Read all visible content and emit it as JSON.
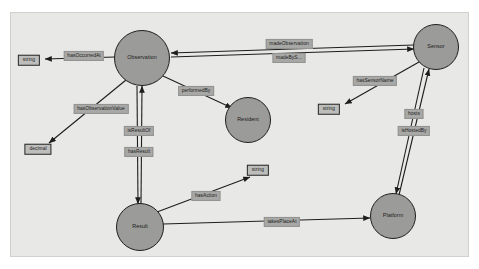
{
  "diagram": {
    "panel": {
      "background": "#e8e8e6",
      "border": "#d0d0cd"
    },
    "node_fill": "#9b9b99",
    "node_stroke": "#1f1f1f",
    "edge_label_fill": "#a8a8a6",
    "literal_fill": "#bdbdbb",
    "edge_stroke": "#1d1d1d",
    "nodes": [
      {
        "id": "observation",
        "label": "Observation",
        "shape": "circle",
        "cx": 142,
        "cy": 58,
        "r": 27
      },
      {
        "id": "sensor",
        "label": "Sensor",
        "shape": "circle",
        "cx": 436,
        "cy": 47,
        "r": 22
      },
      {
        "id": "resident",
        "label": "Resident",
        "shape": "circle",
        "cx": 248,
        "cy": 120,
        "r": 22
      },
      {
        "id": "result",
        "label": "Result",
        "shape": "circle",
        "cx": 140,
        "cy": 227,
        "r": 23
      },
      {
        "id": "platform",
        "label": "Platform",
        "shape": "circle",
        "cx": 393,
        "cy": 216,
        "r": 22
      }
    ],
    "literals": [
      {
        "id": "string-occurred",
        "label": "string",
        "cx": 29,
        "cy": 60
      },
      {
        "id": "decimal-value",
        "label": "decimal",
        "cx": 38,
        "cy": 149
      },
      {
        "id": "string-sensorname",
        "label": "string",
        "cx": 329,
        "cy": 109
      },
      {
        "id": "string-action",
        "label": "string",
        "cx": 258,
        "cy": 170
      }
    ],
    "edges": [
      {
        "id": "hasOccurredAt",
        "label": "hasOccurredAt",
        "from": "observation",
        "to": "string-occurred",
        "lx": 84,
        "ly": 56
      },
      {
        "id": "hasObservationValue",
        "label": "hasObservationValue",
        "from": "observation",
        "to": "decimal-value",
        "lx": 101,
        "ly": 109
      },
      {
        "id": "isResultOf",
        "label": "isResultOf",
        "from": "result",
        "to": "observation",
        "lx": 139,
        "ly": 131
      },
      {
        "id": "hasResult",
        "label": "hasResult",
        "from": "observation",
        "to": "result",
        "lx": 139,
        "ly": 152
      },
      {
        "id": "performedBy",
        "label": "performedBy",
        "from": "observation",
        "to": "resident",
        "lx": 196,
        "ly": 91
      },
      {
        "id": "madeObservation",
        "label": "madeObservation",
        "from": "sensor",
        "to": "observation",
        "lx": 289,
        "ly": 44
      },
      {
        "id": "madeBySensor",
        "label": "madeByS...",
        "from": "observation",
        "to": "sensor",
        "lx": 289,
        "ly": 58
      },
      {
        "id": "hasSensorName",
        "label": "hasSensorName",
        "from": "sensor",
        "to": "string-sensorname",
        "lx": 375,
        "ly": 81
      },
      {
        "id": "hosts",
        "label": "hosts",
        "from": "platform",
        "to": "sensor",
        "lx": 414,
        "ly": 114
      },
      {
        "id": "isHostedBy",
        "label": "isHostedBy",
        "from": "sensor",
        "to": "platform",
        "lx": 414,
        "ly": 131
      },
      {
        "id": "hasAction",
        "label": "hasAction",
        "from": "result",
        "to": "string-action",
        "lx": 206,
        "ly": 196
      },
      {
        "id": "takesPlaceAt",
        "label": "takesPlaceAt",
        "from": "result",
        "to": "platform",
        "lx": 282,
        "ly": 222
      }
    ]
  }
}
